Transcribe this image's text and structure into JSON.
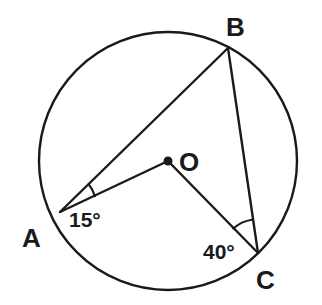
{
  "figure": {
    "background_color": "#ffffff",
    "stroke_color": "#1a1a1a",
    "circle": {
      "name": "circle-O",
      "center_x": 168,
      "center_y": 161,
      "radius": 129,
      "stroke_width": 2.4
    },
    "points": [
      {
        "id": "A",
        "label": "A",
        "x": 60,
        "y": 212,
        "label_x": 22,
        "label_y": 247
      },
      {
        "id": "B",
        "label": "B",
        "x": 228,
        "y": 48,
        "label_x": 226,
        "label_y": 36
      },
      {
        "id": "C",
        "label": "C",
        "x": 258,
        "y": 253,
        "label_x": 256,
        "label_y": 289
      },
      {
        "id": "O",
        "label": "O",
        "x": 168,
        "y": 161,
        "label_x": 179,
        "label_y": 171
      }
    ],
    "center_dot": {
      "name": "center-point-dot",
      "x": 168,
      "y": 161,
      "radius": 4.5
    },
    "segments": [
      {
        "id": "AB",
        "from": "A",
        "to": "B",
        "x1": 60,
        "y1": 212,
        "x2": 228,
        "y2": 48,
        "stroke_width": 2.4
      },
      {
        "id": "AO",
        "from": "A",
        "to": "O",
        "x1": 60,
        "y1": 212,
        "x2": 168,
        "y2": 161,
        "stroke_width": 2.4
      },
      {
        "id": "OC",
        "from": "O",
        "to": "C",
        "x1": 168,
        "y1": 161,
        "x2": 258,
        "y2": 253,
        "stroke_width": 2.4
      },
      {
        "id": "BC",
        "from": "B",
        "to": "C",
        "x1": 228,
        "y1": 48,
        "x2": 258,
        "y2": 253,
        "stroke_width": 2.4
      }
    ],
    "angles": [
      {
        "id": "angle-A",
        "vertex": "A",
        "value": "15°",
        "measure_degrees": 15,
        "between": [
          "AB",
          "AO"
        ],
        "arc_path": "M 88.0 184.6 L 94.6 196.2",
        "label_x": 69,
        "label_y": 227
      },
      {
        "id": "angle-C",
        "vertex": "C",
        "value": "40°",
        "measure_degrees": 40,
        "between": [
          "CO",
          "CB"
        ],
        "arc_path": "M 233.8 228.2 L 251.5 219.5",
        "label_x": 203,
        "label_y": 259
      }
    ]
  }
}
